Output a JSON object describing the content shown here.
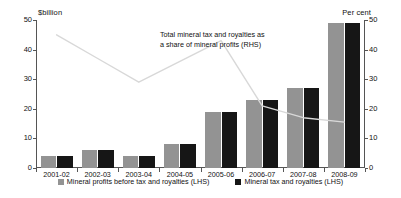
{
  "chart_data": {
    "type": "bar",
    "title": "",
    "categories": [
      "2001-02",
      "2002-03",
      "2003-04",
      "2004-05",
      "2005-06",
      "2006-07",
      "2007-08",
      "2008-09"
    ],
    "series": [
      {
        "name": "Mineral profits before tax and royalties (LHS)",
        "axis": "left",
        "type": "bar",
        "color": "#939393",
        "values": [
          4,
          6,
          4,
          8,
          19,
          23,
          27,
          49
        ]
      },
      {
        "name": "Mineral tax and royalties (LHS)",
        "axis": "left",
        "type": "bar",
        "color": "#161616",
        "values": [
          2,
          2,
          1.8,
          2.6,
          3.2,
          3.6,
          3.7,
          7
        ]
      },
      {
        "name": "Total mineral tax and royalties as a share of mineral profits (RHS)",
        "axis": "right",
        "type": "line",
        "color": "#d8d8d8",
        "values": [
          45,
          37,
          29,
          36,
          43,
          21,
          17,
          15.5
        ]
      }
    ],
    "left_axis": {
      "label": "$billion",
      "min": 0,
      "max": 50,
      "ticks": [
        0,
        10,
        20,
        30,
        40,
        50
      ]
    },
    "right_axis": {
      "label": "Per cent",
      "min": 0,
      "max": 50,
      "ticks": [
        0,
        10,
        20,
        30,
        40,
        50
      ]
    },
    "xlabel": "",
    "grid": false,
    "legend_position": "bottom",
    "annotation": {
      "line1": "Total mineral tax and royalties as",
      "line2": "a share of mineral profits (RHS)"
    }
  },
  "legend": [
    {
      "label": "Mineral profits before tax and royalties (LHS)",
      "swatch": "profits"
    },
    {
      "label": "Mineral tax and royalties (LHS)",
      "swatch": "tax"
    }
  ]
}
